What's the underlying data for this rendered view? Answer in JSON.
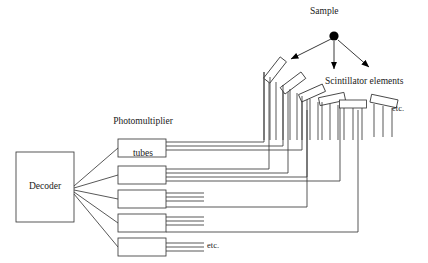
{
  "diagram": {
    "title_visible": false,
    "labels": {
      "sample": "Sample",
      "scintillator_elements": "Scintillator elements",
      "photomultiplier_tubes": "Photomultiplier\ntubes",
      "photomultiplier_line1": "Photomultiplier",
      "photomultiplier_line2": "tubes",
      "decoder": "Decoder",
      "etc_right": "etc.",
      "etc_bottom": "etc."
    },
    "colors": {
      "background": "#ffffff",
      "stroke": "#3a3a3a",
      "text": "#1a1a1a",
      "sample_dot": "#000000",
      "arrow_fill": "#000000"
    },
    "sample_source": {
      "name": "sample-point",
      "cx": 334,
      "cy": 36,
      "radius": 4.6,
      "emission_arrows": [
        {
          "name": "arrow-left",
          "x1": 331,
          "y1": 39,
          "x2": 289,
          "y2": 60
        },
        {
          "name": "arrow-down",
          "x1": 334,
          "y1": 41,
          "x2": 334,
          "y2": 71
        },
        {
          "name": "arrow-right",
          "x1": 338,
          "y1": 40,
          "x2": 371,
          "y2": 69
        }
      ]
    },
    "scintillator_elements": [
      {
        "id": 1,
        "cx": 275,
        "cy": 70,
        "w": 27,
        "h": 8,
        "rot": -52,
        "guides": 3
      },
      {
        "id": 2,
        "cx": 293,
        "cy": 83,
        "w": 26,
        "h": 8,
        "rot": -37,
        "guides": 3
      },
      {
        "id": 3,
        "cx": 312,
        "cy": 93,
        "w": 26,
        "h": 8,
        "rot": -24,
        "guides": 3
      },
      {
        "id": 4,
        "cx": 332,
        "cy": 99,
        "w": 26,
        "h": 8,
        "rot": -12,
        "guides": 3
      },
      {
        "id": 5,
        "cx": 353,
        "cy": 104,
        "w": 27,
        "h": 8,
        "rot": 0,
        "guides": 3
      },
      {
        "id": 6,
        "cx": 384,
        "cy": 101,
        "w": 27,
        "h": 8,
        "rot": 12,
        "guides": 3
      }
    ],
    "photomultiplier_tubes": [
      {
        "id": 1,
        "x": 118,
        "y": 139,
        "w": 48,
        "h": 18,
        "output_wires": 3
      },
      {
        "id": 2,
        "x": 118,
        "y": 166,
        "w": 48,
        "h": 18,
        "output_wires": 3
      },
      {
        "id": 3,
        "x": 118,
        "y": 190,
        "w": 48,
        "h": 18,
        "output_wires": 3
      },
      {
        "id": 4,
        "x": 118,
        "y": 214,
        "w": 48,
        "h": 18,
        "output_wires": 3
      },
      {
        "id": 5,
        "x": 118,
        "y": 238,
        "w": 48,
        "h": 18,
        "output_wires": 3
      }
    ],
    "decoder_box": {
      "x": 16,
      "y": 152,
      "w": 58,
      "h": 70
    },
    "decoder_to_pmt_links": 5,
    "counts": {
      "scintillators_drawn": 6,
      "pmts_drawn": 5,
      "emission_arrows": 3,
      "light_guides_per_element": 3
    }
  }
}
